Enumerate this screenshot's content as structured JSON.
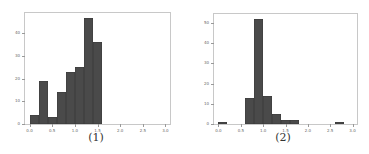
{
  "chart_data": [
    {
      "type": "bar",
      "title": "",
      "caption": "(1)",
      "xlabel": "",
      "ylabel": "",
      "xlim": [
        -0.1,
        3.1
      ],
      "ylim": [
        0,
        49
      ],
      "bin_width": 0.2,
      "bins": [
        {
          "x0": 0.0,
          "x1": 0.2,
          "count": 4
        },
        {
          "x0": 0.2,
          "x1": 0.4,
          "count": 19
        },
        {
          "x0": 0.4,
          "x1": 0.6,
          "count": 3
        },
        {
          "x0": 0.6,
          "x1": 0.8,
          "count": 14
        },
        {
          "x0": 0.8,
          "x1": 1.0,
          "count": 23
        },
        {
          "x0": 1.0,
          "x1": 1.2,
          "count": 25
        },
        {
          "x0": 1.2,
          "x1": 1.4,
          "count": 47
        },
        {
          "x0": 1.4,
          "x1": 1.6,
          "count": 36
        }
      ],
      "xticks": [
        "0.0",
        "0.5",
        "1.0",
        "1.5",
        "2.0",
        "2.5",
        "3.0"
      ],
      "yticks": [
        "0",
        "10",
        "20",
        "30",
        "40"
      ],
      "grid": false
    },
    {
      "type": "bar",
      "title": "",
      "caption": "(2)",
      "xlabel": "",
      "ylabel": "",
      "xlim": [
        -0.1,
        3.1
      ],
      "ylim": [
        0,
        54.5
      ],
      "bin_width": 0.2,
      "bins": [
        {
          "x0": 0.0,
          "x1": 0.2,
          "count": 1
        },
        {
          "x0": 0.6,
          "x1": 0.8,
          "count": 13
        },
        {
          "x0": 0.8,
          "x1": 1.0,
          "count": 52
        },
        {
          "x0": 1.0,
          "x1": 1.2,
          "count": 14
        },
        {
          "x0": 1.2,
          "x1": 1.4,
          "count": 5
        },
        {
          "x0": 1.4,
          "x1": 1.6,
          "count": 2
        },
        {
          "x0": 1.6,
          "x1": 1.8,
          "count": 2
        },
        {
          "x0": 2.6,
          "x1": 2.8,
          "count": 1
        }
      ],
      "xticks": [
        "0.0",
        "0.5",
        "1.0",
        "1.5",
        "2.0",
        "2.5",
        "3.0"
      ],
      "yticks": [
        "0",
        "10",
        "20",
        "30",
        "40",
        "50"
      ],
      "grid": false
    }
  ],
  "captions": [
    "(1)",
    "(2)"
  ],
  "bar_color": "#4a4a4a"
}
